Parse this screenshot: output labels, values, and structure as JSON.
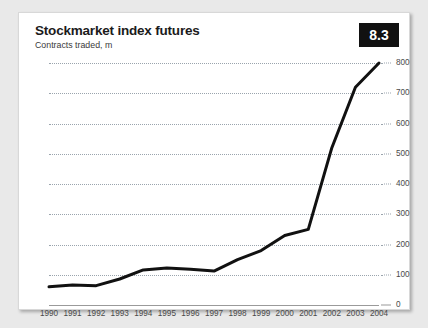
{
  "card": {
    "title": "Stockmarket index futures",
    "subtitle": "Contracts traded, m",
    "badge_label": "8.3",
    "badge_bg": "#111111",
    "badge_fg": "#ffffff"
  },
  "colors": {
    "line": "#111111",
    "grid": "#9aa4ad",
    "axis": "#9a9a9a",
    "tick_text": "#4a4a4a",
    "title_text": "#1b1b1b",
    "card_bg": "#ffffff",
    "page_bg": "#e9e9e9"
  },
  "chart_data": {
    "type": "line",
    "title": "Stockmarket index futures",
    "subtitle": "Contracts traded, m",
    "xlabel": "",
    "ylabel": "Contracts traded, m",
    "x": [
      1990,
      1991,
      1992,
      1993,
      1994,
      1995,
      1996,
      1997,
      1998,
      1999,
      2000,
      2001,
      2002,
      2003,
      2004
    ],
    "categories": [
      "1990",
      "1991",
      "1992",
      "1993",
      "1994",
      "1995",
      "1996",
      "1997",
      "1998",
      "1999",
      "2000",
      "2001",
      "2002",
      "2003",
      "2004"
    ],
    "values": [
      60,
      66,
      64,
      86,
      116,
      122,
      118,
      112,
      150,
      180,
      230,
      250,
      520,
      720,
      800
    ],
    "series": [
      {
        "name": "Contracts traded, m",
        "values": [
          60,
          66,
          64,
          86,
          116,
          122,
          118,
          112,
          150,
          180,
          230,
          250,
          520,
          720,
          800
        ]
      }
    ],
    "ylim": [
      0,
      800
    ],
    "yticks": [
      0,
      100,
      200,
      300,
      400,
      500,
      600,
      700,
      800
    ],
    "ytick_labels": [
      "0",
      "100",
      "200",
      "300",
      "400",
      "500",
      "600",
      "700",
      "800"
    ],
    "y_axis_position": "right",
    "xlim": [
      1990,
      2004
    ],
    "grid": true,
    "grid_style": "dotted-horizontal",
    "legend": false
  }
}
